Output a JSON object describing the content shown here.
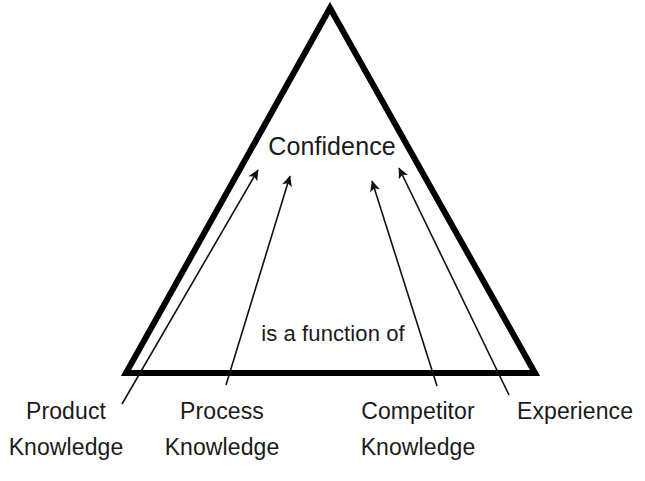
{
  "diagram": {
    "type": "triangle-hierarchy",
    "apex_label": "Confidence",
    "relation_label": "is a function of",
    "shape": {
      "name": "triangle",
      "apex": [
        330,
        8
      ],
      "bottom_left": [
        126,
        373
      ],
      "bottom_right": [
        535,
        373
      ],
      "stroke_color": "#000000",
      "stroke_width": 6
    },
    "arrow_color": "#111111",
    "arrow_width": 1.6,
    "inputs": [
      {
        "id": "product",
        "line1": "Product",
        "line2": "Knowledge",
        "arrow_tail": [
          122,
          404
        ],
        "arrow_head": [
          258,
          170
        ]
      },
      {
        "id": "process",
        "line1": "Process",
        "line2": "Knowledge",
        "arrow_tail": [
          226,
          385
        ],
        "arrow_head": [
          290,
          176
        ]
      },
      {
        "id": "competitor",
        "line1": "Competitor",
        "line2": "Knowledge",
        "arrow_tail": [
          437,
          386
        ],
        "arrow_head": [
          372,
          181
        ]
      },
      {
        "id": "experience",
        "line1": "Experience",
        "line2": "",
        "arrow_tail": [
          509,
          395
        ],
        "arrow_head": [
          399,
          168
        ]
      }
    ]
  }
}
